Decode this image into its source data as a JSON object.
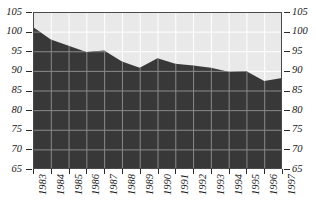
{
  "chart_data": {
    "type": "area",
    "title": "",
    "subtitle": "",
    "xlabel": "",
    "ylabel": "",
    "categories": [
      "1983",
      "1984",
      "1985",
      "1986",
      "1987",
      "1988",
      "1989",
      "1990",
      "1991",
      "1992",
      "1993",
      "1994",
      "1995",
      "1996",
      "1997"
    ],
    "values": [
      101.2,
      98.0,
      96.4,
      94.8,
      95.2,
      92.4,
      90.8,
      93.2,
      91.8,
      91.4,
      90.8,
      89.8,
      89.9,
      87.4,
      88.2
    ],
    "series": [
      {
        "name": "Index",
        "values": [
          101.2,
          98.0,
          96.4,
          94.8,
          95.2,
          92.4,
          90.8,
          93.2,
          91.8,
          91.4,
          90.8,
          89.8,
          89.9,
          87.4,
          88.2
        ]
      }
    ],
    "ylim": [
      65,
      105
    ],
    "yticks": [
      65,
      70,
      75,
      80,
      85,
      90,
      95,
      100,
      105
    ],
    "ytick_labels": [
      "65",
      "70",
      "75",
      "80",
      "85",
      "90",
      "95",
      "100",
      "105"
    ],
    "xlim": [
      "1983",
      "1997"
    ],
    "grid": true,
    "grid_x": true,
    "grid_y": true,
    "legend": null,
    "legend_position": "none",
    "dual_y_axis": true,
    "annotations": []
  },
  "axes": {
    "left_ticks": [
      "105",
      "100",
      "95",
      "90",
      "85",
      "80",
      "75",
      "70",
      "65"
    ],
    "right_ticks": [
      "105",
      "100",
      "95",
      "90",
      "85",
      "80",
      "75",
      "70",
      "65"
    ],
    "x_ticks": [
      "1983",
      "1984",
      "1985",
      "1986",
      "1987",
      "1988",
      "1989",
      "1990",
      "1991",
      "1992",
      "1993",
      "1994",
      "1995",
      "1996",
      "1997"
    ]
  },
  "colors": {
    "area_fill": "#383838",
    "plot_background": "#e9e9e9",
    "grid_upper": "#ffffff",
    "grid_lower": "#8a8a8a",
    "axis_text": "#1a1a1a",
    "page_background": "#ffffff"
  }
}
